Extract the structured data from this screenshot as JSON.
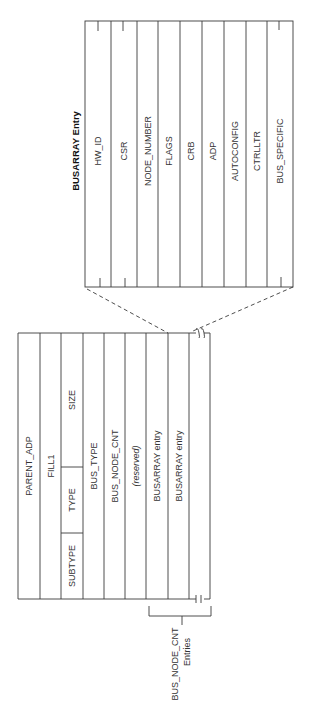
{
  "busarray_entry": {
    "title": "BUSARRAY Entry",
    "fields": [
      "HW_ID",
      "CSR",
      "NODE_NUMBER",
      "FLAGS",
      "CRB",
      "ADP",
      "AUTOCONFIG",
      "CTRLLTR",
      "BUS_SPECIFIC"
    ]
  },
  "adapter_block": {
    "fields": {
      "parent_adp": "PARENT_ADP",
      "fill1": "FILL1",
      "size": "SIZE",
      "type": "TYPE",
      "subtype": "SUBTYPE",
      "bus_type": "BUS_TYPE",
      "bus_node_cnt": "BUS_NODE_CNT",
      "reserved": "(reserved)",
      "busarray_entry_1": "BUSARRAY entry",
      "busarray_entry_2": "BUSARRAY entry"
    }
  },
  "bracket_label": {
    "line1": "BUS_NODE_CNT",
    "line2": "Entries"
  },
  "colors": {
    "line": "#3a3a3a",
    "text": "#333333",
    "background": "#ffffff"
  }
}
